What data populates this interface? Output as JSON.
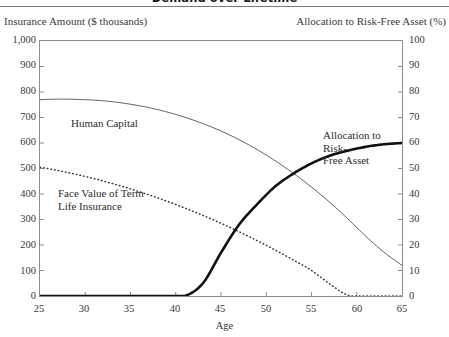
{
  "title": "Demand over Lifetime",
  "axes": {
    "left_title": "Insurance Amount ($ thousands)",
    "right_title": "Allocation to Risk-Free Asset (%)",
    "x_title": "Age",
    "left_ticks": [
      "1,000",
      "900",
      "800",
      "700",
      "600",
      "500",
      "400",
      "300",
      "200",
      "100",
      "0"
    ],
    "right_ticks": [
      "100",
      "90",
      "80",
      "70",
      "60",
      "50",
      "40",
      "30",
      "20",
      "10",
      "0"
    ],
    "x_ticks": [
      "25",
      "30",
      "35",
      "40",
      "45",
      "50",
      "55",
      "60",
      "65"
    ]
  },
  "labels": {
    "human_capital": "Human Capital",
    "face_value": "Face Value of Term\nLife Insurance",
    "allocation": "Allocation to Risk-\nFree Asset"
  },
  "chart_data": {
    "type": "line",
    "title": "Demand over Lifetime",
    "xlabel": "Age",
    "ylabel": "Insurance Amount ($ thousands)",
    "y2label": "Allocation to Risk-Free Asset (%)",
    "xlim": [
      25,
      65
    ],
    "ylim": [
      0,
      1000
    ],
    "y2lim": [
      0,
      100
    ],
    "grid": false,
    "legend": "in-plot annotations",
    "x": [
      25,
      27,
      29,
      31,
      33,
      35,
      37,
      39,
      41,
      43,
      45,
      47,
      49,
      51,
      53,
      55,
      57,
      59,
      61,
      63,
      65
    ],
    "series": [
      {
        "name": "Human Capital",
        "axis": "left",
        "style": "thin-solid",
        "values": [
          770,
          772,
          771,
          768,
          762,
          752,
          739,
          722,
          701,
          676,
          647,
          613,
          574,
          530,
          481,
          427,
          368,
          303,
          234,
          172,
          120
        ]
      },
      {
        "name": "Face Value of Term Life Insurance",
        "axis": "left",
        "style": "dotted",
        "values": [
          505,
          492,
          477,
          460,
          441,
          420,
          397,
          372,
          345,
          316,
          285,
          252,
          217,
          180,
          141,
          100,
          48,
          3,
          0,
          0,
          0
        ]
      },
      {
        "name": "Allocation to Risk-Free Asset",
        "axis": "right",
        "style": "thick-solid",
        "values": [
          0,
          0,
          0,
          0,
          0,
          0,
          0,
          0,
          0,
          5,
          17,
          28,
          36,
          43,
          48,
          52,
          55,
          57,
          58.5,
          59.5,
          60
        ]
      }
    ]
  }
}
